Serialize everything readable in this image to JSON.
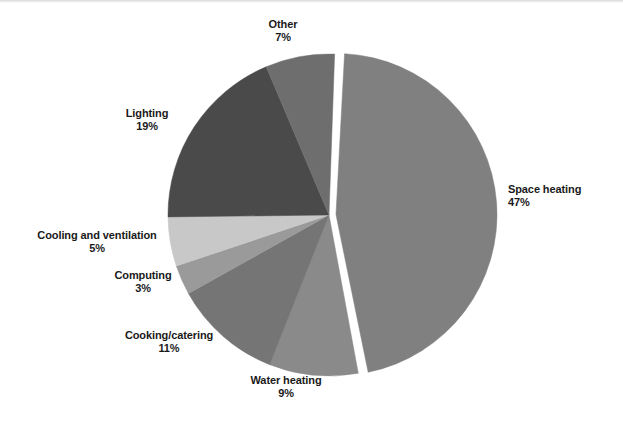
{
  "figure": {
    "title": "",
    "background_color": "#ffffff",
    "label_color": "#1a1a1a"
  },
  "chart_data": {
    "type": "pie",
    "title": "",
    "xlabel": "",
    "ylabel": "",
    "grid": false,
    "legend_position": "none",
    "label_format": "name + percent",
    "units": "percent",
    "total": 101,
    "exploded_slice": "Space heating",
    "start_angle_deg": -88,
    "direction": "clockwise",
    "categories": [
      "Space heating",
      "Water heating",
      "Cooking/catering",
      "Computing",
      "Cooling and ventilation",
      "Lighting",
      "Other"
    ],
    "values": [
      47,
      9,
      11,
      3,
      5,
      19,
      7
    ],
    "colors": [
      "#808080",
      "#8a8a8a",
      "#757575",
      "#9a9a9a",
      "#c8c8c8",
      "#4a4a4a",
      "#6e6e6e"
    ],
    "slices": [
      {
        "label": "Space heating",
        "value": 47,
        "value_text": "47%",
        "color": "#808080",
        "exploded": true
      },
      {
        "label": "Water heating",
        "value": 9,
        "value_text": "9%",
        "color": "#8a8a8a",
        "exploded": false
      },
      {
        "label": "Cooking/catering",
        "value": 11,
        "value_text": "11%",
        "color": "#757575",
        "exploded": false
      },
      {
        "label": "Computing",
        "value": 3,
        "value_text": "3%",
        "color": "#9a9a9a",
        "exploded": false
      },
      {
        "label": "Cooling and ventilation",
        "value": 5,
        "value_text": "5%",
        "color": "#c8c8c8",
        "exploded": false
      },
      {
        "label": "Lighting",
        "value": 19,
        "value_text": "19%",
        "color": "#4a4a4a",
        "exploded": false
      },
      {
        "label": "Other",
        "value": 7,
        "value_text": "7%",
        "color": "#6e6e6e",
        "exploded": false
      }
    ]
  }
}
